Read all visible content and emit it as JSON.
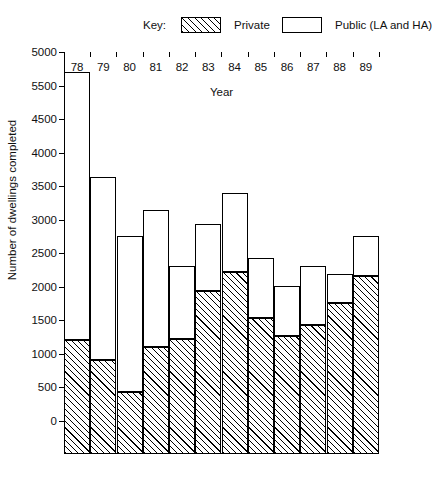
{
  "legend": {
    "key_label": "Key:",
    "private_label": "Private",
    "public_label": "Public (LA and HA)",
    "private_swatch": "hatched-swatch",
    "public_swatch": "open-swatch"
  },
  "axes": {
    "y_title": "Number of dwellings completed",
    "x_title": "Year"
  },
  "chart_data": {
    "type": "bar",
    "title": "",
    "subtitle": "",
    "xlabel": "Year",
    "ylabel": "Number of dwellings completed",
    "stacked": true,
    "grid": false,
    "legend_position": "top",
    "ylim": [
      0,
      6000
    ],
    "ytick_interval": 500,
    "ytick_labels_as_printed": [
      "5000",
      "5500",
      "4500",
      "4000",
      "3500",
      "3000",
      "2500",
      "2000",
      "1500",
      "1000",
      "500",
      "0"
    ],
    "ytick_values": [
      6000,
      5500,
      5000,
      4500,
      4000,
      3500,
      3000,
      2500,
      2000,
      1500,
      1000,
      500,
      0
    ],
    "note_on_axis": "Top printed label reads 5000 but sits above 5500; ticks are uniform 500-unit steps, so the axis runs 6000 down to 0.",
    "categories": [
      "78",
      "79",
      "80",
      "81",
      "82",
      "83",
      "84",
      "85",
      "86",
      "87",
      "88",
      "89"
    ],
    "series": [
      {
        "name": "Private",
        "values": [
          1700,
          1400,
          920,
          1600,
          1710,
          2440,
          2720,
          2030,
          1760,
          1920,
          2250,
          2650
        ]
      },
      {
        "name": "Public (LA and HA)",
        "values": [
          4000,
          2740,
          2330,
          2040,
          1090,
          990,
          1180,
          900,
          750,
          890,
          430,
          600
        ]
      }
    ],
    "totals": [
      5700,
      4140,
      3250,
      3640,
      2800,
      3430,
      3900,
      2930,
      2510,
      2810,
      2680,
      3250
    ]
  }
}
